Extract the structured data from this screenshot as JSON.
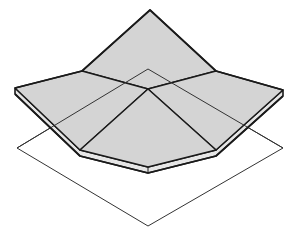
{
  "diagram": {
    "colors": {
      "background": "#ffffff",
      "surface_fill": "#d4d4d4",
      "edge_fill": "#e6e6e6",
      "stroke": "#1a1a1a",
      "thin_stroke": "#333333"
    },
    "base_square": {
      "points": [
        [
          148,
          69
        ],
        [
          283,
          148
        ],
        [
          148,
          226
        ],
        [
          17,
          148
        ]
      ]
    },
    "surface": {
      "apex": [
        150,
        10
      ],
      "fold_left": [
        82,
        71
      ],
      "fold_right": [
        216,
        71
      ],
      "center": [
        148,
        89
      ],
      "outer_left": [
        15,
        88
      ],
      "outer_right": [
        283,
        90
      ],
      "bottom_left": [
        80,
        150
      ],
      "bottom_right": [
        216,
        150
      ],
      "front": [
        148,
        167
      ],
      "thickness": 5
    }
  }
}
